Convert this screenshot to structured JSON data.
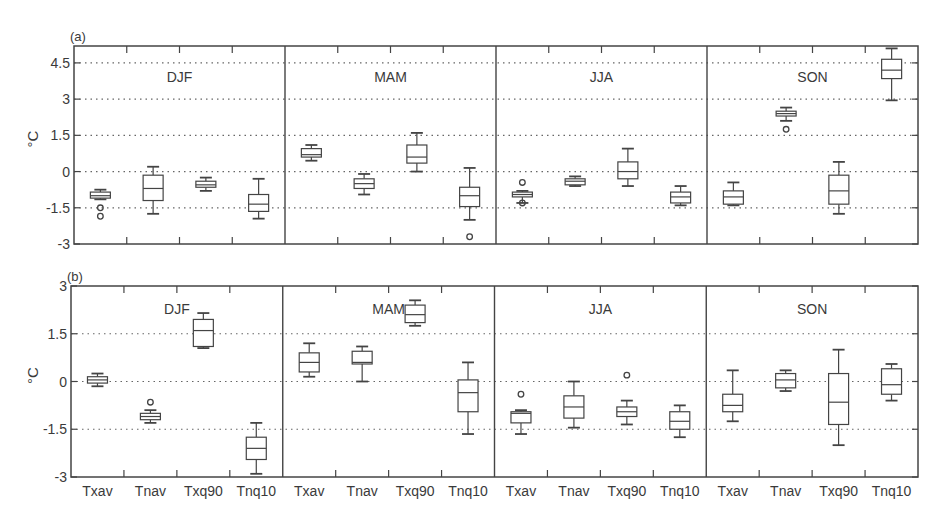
{
  "chart_data": [
    {
      "type": "box",
      "panel_label": "(a)",
      "title": "",
      "ylabel": "°C",
      "xlabel": "",
      "ylim": [
        -3,
        5.2
      ],
      "yticks": [
        -3,
        -1.5,
        0,
        1.5,
        3,
        4.5
      ],
      "ytick_labels": [
        "-3",
        "-1.5",
        "0",
        "1.5",
        "3",
        "4.5"
      ],
      "grid": "horizontal dotted",
      "show_xtick_labels": false,
      "categories": [
        "Txav",
        "Tnav",
        "Txq90",
        "Tnq10"
      ],
      "groups": [
        {
          "season": "DJF",
          "boxes": [
            {
              "var": "Txav",
              "whislo": -1.15,
              "q1": -1.1,
              "med": -1.0,
              "q3": -0.85,
              "whishi": -0.75,
              "fliers": [
                -1.5,
                -1.85
              ]
            },
            {
              "var": "Tnav",
              "whislo": -1.75,
              "q1": -1.2,
              "med": -0.7,
              "q3": -0.15,
              "whishi": 0.2,
              "fliers": []
            },
            {
              "var": "Txq90",
              "whislo": -0.8,
              "q1": -0.65,
              "med": -0.55,
              "q3": -0.4,
              "whishi": -0.25,
              "fliers": []
            },
            {
              "var": "Tnq10",
              "whislo": -1.95,
              "q1": -1.65,
              "med": -1.35,
              "q3": -0.95,
              "whishi": -0.3,
              "fliers": []
            }
          ]
        },
        {
          "season": "MAM",
          "boxes": [
            {
              "var": "Txav",
              "whislo": 0.45,
              "q1": 0.6,
              "med": 0.7,
              "q3": 0.95,
              "whishi": 1.1,
              "fliers": []
            },
            {
              "var": "Tnav",
              "whislo": -0.95,
              "q1": -0.7,
              "med": -0.5,
              "q3": -0.3,
              "whishi": -0.1,
              "fliers": []
            },
            {
              "var": "Txq90",
              "whislo": 0.0,
              "q1": 0.35,
              "med": 0.6,
              "q3": 1.1,
              "whishi": 1.6,
              "fliers": []
            },
            {
              "var": "Tnq10",
              "whislo": -2.0,
              "q1": -1.45,
              "med": -1.0,
              "q3": -0.65,
              "whishi": 0.15,
              "fliers": [
                -2.7
              ]
            }
          ]
        },
        {
          "season": "JJA",
          "boxes": [
            {
              "var": "Txav",
              "whislo": -1.3,
              "q1": -1.05,
              "med": -0.95,
              "q3": -0.85,
              "whishi": -0.8,
              "fliers": [
                -0.45,
                -1.3
              ]
            },
            {
              "var": "Tnav",
              "whislo": -0.6,
              "q1": -0.55,
              "med": -0.4,
              "q3": -0.3,
              "whishi": -0.2,
              "fliers": []
            },
            {
              "var": "Txq90",
              "whislo": -0.6,
              "q1": -0.3,
              "med": 0.0,
              "q3": 0.4,
              "whishi": 0.95,
              "fliers": []
            },
            {
              "var": "Tnq10",
              "whislo": -1.4,
              "q1": -1.3,
              "med": -1.05,
              "q3": -0.85,
              "whishi": -0.6,
              "fliers": []
            }
          ]
        },
        {
          "season": "SON",
          "boxes": [
            {
              "var": "Txav",
              "whislo": -1.4,
              "q1": -1.35,
              "med": -1.05,
              "q3": -0.8,
              "whishi": -0.45,
              "fliers": []
            },
            {
              "var": "Tnav",
              "whislo": 2.1,
              "q1": 2.3,
              "med": 2.4,
              "q3": 2.5,
              "whishi": 2.65,
              "fliers": [
                1.75
              ]
            },
            {
              "var": "Txq90",
              "whislo": -1.75,
              "q1": -1.35,
              "med": -0.8,
              "q3": -0.15,
              "whishi": 0.4,
              "fliers": []
            },
            {
              "var": "Tnq10",
              "whislo": 2.95,
              "q1": 3.85,
              "med": 4.2,
              "q3": 4.65,
              "whishi": 5.1,
              "fliers": []
            }
          ]
        }
      ]
    },
    {
      "type": "box",
      "panel_label": "(b)",
      "title": "",
      "ylabel": "°C",
      "xlabel": "",
      "ylim": [
        -3,
        3
      ],
      "yticks": [
        -3,
        -1.5,
        0,
        1.5,
        3
      ],
      "ytick_labels": [
        "-3",
        "-1.5",
        "0",
        "1.5",
        "3"
      ],
      "grid": "horizontal dotted",
      "show_xtick_labels": true,
      "categories": [
        "Txav",
        "Tnav",
        "Txq90",
        "Tnq10"
      ],
      "groups": [
        {
          "season": "DJF",
          "boxes": [
            {
              "var": "Txav",
              "whislo": -0.15,
              "q1": -0.05,
              "med": 0.05,
              "q3": 0.15,
              "whishi": 0.25,
              "fliers": []
            },
            {
              "var": "Tnav",
              "whislo": -1.3,
              "q1": -1.2,
              "med": -1.1,
              "q3": -1.0,
              "whishi": -0.9,
              "fliers": [
                -0.65
              ]
            },
            {
              "var": "Txq90",
              "whislo": 1.05,
              "q1": 1.1,
              "med": 1.6,
              "q3": 1.95,
              "whishi": 2.15,
              "fliers": []
            },
            {
              "var": "Tnq10",
              "whislo": -2.9,
              "q1": -2.45,
              "med": -2.1,
              "q3": -1.75,
              "whishi": -1.3,
              "fliers": []
            }
          ]
        },
        {
          "season": "MAM",
          "boxes": [
            {
              "var": "Txav",
              "whislo": 0.15,
              "q1": 0.3,
              "med": 0.6,
              "q3": 0.9,
              "whishi": 1.2,
              "fliers": []
            },
            {
              "var": "Tnav",
              "whislo": 0.0,
              "q1": 0.55,
              "med": 0.6,
              "q3": 0.95,
              "whishi": 1.1,
              "fliers": []
            },
            {
              "var": "Txq90",
              "whislo": 1.75,
              "q1": 1.85,
              "med": 2.1,
              "q3": 2.4,
              "whishi": 2.55,
              "fliers": []
            },
            {
              "var": "Tnq10",
              "whislo": -1.65,
              "q1": -0.95,
              "med": -0.35,
              "q3": 0.05,
              "whishi": 0.6,
              "fliers": []
            }
          ]
        },
        {
          "season": "JJA",
          "boxes": [
            {
              "var": "Txav",
              "whislo": -1.65,
              "q1": -1.3,
              "med": -1.0,
              "q3": -0.95,
              "whishi": -0.9,
              "fliers": [
                -0.4
              ]
            },
            {
              "var": "Tnav",
              "whislo": -1.45,
              "q1": -1.15,
              "med": -0.8,
              "q3": -0.45,
              "whishi": 0.0,
              "fliers": []
            },
            {
              "var": "Txq90",
              "whislo": -1.35,
              "q1": -1.1,
              "med": -0.95,
              "q3": -0.8,
              "whishi": -0.6,
              "fliers": [
                0.2
              ]
            },
            {
              "var": "Tnq10",
              "whislo": -1.75,
              "q1": -1.5,
              "med": -1.25,
              "q3": -0.95,
              "whishi": -0.75,
              "fliers": []
            }
          ]
        },
        {
          "season": "SON",
          "boxes": [
            {
              "var": "Txav",
              "whislo": -1.25,
              "q1": -0.95,
              "med": -0.75,
              "q3": -0.4,
              "whishi": 0.35,
              "fliers": []
            },
            {
              "var": "Tnav",
              "whislo": -0.3,
              "q1": -0.2,
              "med": 0.05,
              "q3": 0.25,
              "whishi": 0.35,
              "fliers": []
            },
            {
              "var": "Txq90",
              "whislo": -2.0,
              "q1": -1.35,
              "med": -0.65,
              "q3": 0.25,
              "whishi": 1.0,
              "fliers": []
            },
            {
              "var": "Tnq10",
              "whislo": -0.6,
              "q1": -0.4,
              "med": -0.1,
              "q3": 0.4,
              "whishi": 0.55,
              "fliers": []
            }
          ]
        }
      ]
    }
  ],
  "layout": {
    "panels": [
      {
        "left": 74,
        "right": 918,
        "top": 46,
        "bottom": 244,
        "y_top_val": 5.2,
        "y_bot_val": -3
      },
      {
        "left": 71,
        "right": 918,
        "top": 286,
        "bottom": 477,
        "y_top_val": 3,
        "y_bot_val": -3
      }
    ]
  }
}
